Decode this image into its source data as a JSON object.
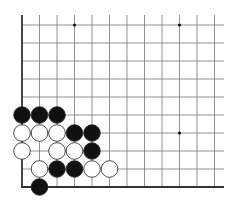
{
  "board": {
    "title": "Go problem diagram (lower-left corner)",
    "origin_x": 22,
    "origin_y": 25,
    "spacing_x": 17.5,
    "spacing_y": 18,
    "cols": 12,
    "rows": 10,
    "right_extent": 224,
    "top_extent": 15,
    "line_color": "#777777",
    "edge_color": "#333333",
    "stone_radius": 8.3,
    "star_points": [
      {
        "col": 3,
        "row": 0
      },
      {
        "col": 9,
        "row": 0
      },
      {
        "col": 9,
        "row": 6
      }
    ],
    "stones": [
      {
        "color": "black",
        "col": 0,
        "row": 5
      },
      {
        "color": "black",
        "col": 1,
        "row": 5
      },
      {
        "color": "black",
        "col": 2,
        "row": 5
      },
      {
        "color": "white",
        "col": 0,
        "row": 6
      },
      {
        "color": "white",
        "col": 1,
        "row": 6
      },
      {
        "color": "white",
        "col": 2,
        "row": 6
      },
      {
        "color": "black",
        "col": 3,
        "row": 6
      },
      {
        "color": "black",
        "col": 4,
        "row": 6
      },
      {
        "color": "white",
        "col": 0,
        "row": 7
      },
      {
        "color": "white",
        "col": 2,
        "row": 7
      },
      {
        "color": "white",
        "col": 3,
        "row": 7
      },
      {
        "color": "black",
        "col": 4,
        "row": 7
      },
      {
        "color": "white",
        "col": 1,
        "row": 8
      },
      {
        "color": "black",
        "col": 2,
        "row": 8
      },
      {
        "color": "black",
        "col": 3,
        "row": 8
      },
      {
        "color": "white",
        "col": 4,
        "row": 8
      },
      {
        "color": "white",
        "col": 5,
        "row": 8
      },
      {
        "color": "black",
        "col": 1,
        "row": 9
      }
    ]
  }
}
